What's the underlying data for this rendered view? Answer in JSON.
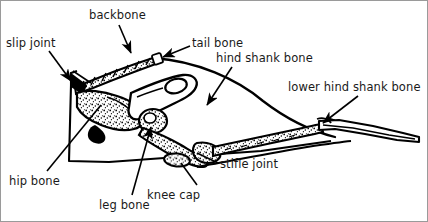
{
  "figure": {
    "width": 428,
    "height": 222,
    "background_color": "#ffffff",
    "ink_color": "#000000",
    "border_color": "#9a9a9a",
    "labels": [
      {
        "id": "backbone",
        "text": "backbone",
        "x": 88,
        "y": 8
      },
      {
        "id": "slip-joint",
        "text": "slip joint",
        "x": 5,
        "y": 36
      },
      {
        "id": "tail-bone",
        "text": "tail bone",
        "x": 191,
        "y": 36
      },
      {
        "id": "hind-shank-bone",
        "text": "hind shank bone",
        "x": 215,
        "y": 51
      },
      {
        "id": "lower-hind-shank-bone",
        "text": "lower hind shank bone",
        "x": 287,
        "y": 80
      },
      {
        "id": "hip-bone",
        "text": "hip bone",
        "x": 8,
        "y": 174
      },
      {
        "id": "knee-cap",
        "text": "knee cap",
        "x": 146,
        "y": 188
      },
      {
        "id": "leg-bone",
        "text": "leg bone",
        "x": 98,
        "y": 198
      },
      {
        "id": "stifle-joint",
        "text": "stifle joint",
        "x": 219,
        "y": 157
      }
    ],
    "leader_lines": [
      {
        "id": "backbone",
        "from": [
          118,
          24
        ],
        "to": [
          130,
          54
        ],
        "arrow": true
      },
      {
        "id": "slip-joint",
        "from": [
          60,
          52
        ],
        "to": [
          72,
          81
        ],
        "arrow": true
      },
      {
        "id": "tail-bone",
        "from": [
          189,
          45
        ],
        "to": [
          159,
          57
        ],
        "arrow": true
      },
      {
        "id": "hind-shank-bone",
        "from": [
          231,
          66
        ],
        "to": [
          192,
          106
        ],
        "arrow": false
      },
      {
        "id": "lower-hind-shank-bone",
        "from": [
          357,
          95
        ],
        "to": [
          320,
          123
        ],
        "arrow": true
      },
      {
        "id": "hip-bone",
        "from": [
          46,
          170
        ],
        "to": [
          99,
          105
        ],
        "arrow": false
      },
      {
        "id": "knee-cap",
        "from": [
          196,
          180
        ],
        "to": [
          182,
          160
        ],
        "arrow": false
      },
      {
        "id": "leg-bone",
        "from": [
          131,
          194
        ],
        "to": [
          148,
          128
        ],
        "arrow": true
      },
      {
        "id": "stifle-joint",
        "from": [
          217,
          162
        ],
        "to": [
          178,
          149
        ],
        "arrow": false
      }
    ]
  }
}
